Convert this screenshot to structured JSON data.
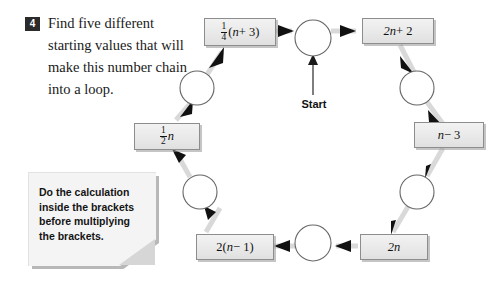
{
  "question": {
    "number": "4",
    "text": "Find five different starting values that will make this number chain into a loop."
  },
  "note": {
    "text": "Do the calculation inside the brackets before multiplying the brackets."
  },
  "diagram": {
    "start_label": "Start",
    "nodes": [
      {
        "id": "start",
        "type": "circle",
        "cx": 313,
        "cy": 38,
        "r": 18
      },
      {
        "id": "node-2",
        "type": "circle",
        "cx": 417,
        "cy": 88,
        "r": 17
      },
      {
        "id": "node-3",
        "type": "circle",
        "cx": 417,
        "cy": 192,
        "r": 17
      },
      {
        "id": "node-4",
        "type": "circle",
        "cx": 313,
        "cy": 243,
        "r": 18
      },
      {
        "id": "node-5",
        "type": "circle",
        "cx": 200,
        "cy": 192,
        "r": 17
      },
      {
        "id": "node-6",
        "type": "circle",
        "cx": 197,
        "cy": 88,
        "r": 17
      }
    ],
    "operations": [
      {
        "id": "op-2nplus2",
        "label": "2n + 2",
        "plain": "2n + 2"
      },
      {
        "id": "op-nminus3",
        "label": "n - 3",
        "plain": "n − 3"
      },
      {
        "id": "op-2n",
        "label": "2n",
        "plain": "2n"
      },
      {
        "id": "op-2nminus1",
        "label": "2(n - 1)",
        "plain": "2(n − 1)"
      },
      {
        "id": "op-halfn",
        "label": "1/2 n",
        "numerator": "1",
        "denominator": "2",
        "suffix": "n"
      },
      {
        "id": "op-quarter",
        "label": "1/4 (n + 3)",
        "numerator": "1",
        "denominator": "4",
        "suffix": "(n + 3)"
      }
    ],
    "box_text": {
      "quarter_num": "1",
      "quarter_den": "4",
      "quarter_rest_open": "(",
      "quarter_rest_var": "n",
      "quarter_rest_close": " + 3)",
      "twon_plus_two_var": "2n",
      "twon_plus_two_rest": " + 2",
      "nminus3_var": "n",
      "nminus3_rest": " − 3",
      "twon_var": "2n",
      "two_nminus1_lead": "2(",
      "two_nminus1_var": "n",
      "two_nminus1_rest": " − 1)",
      "halfn_num": "1",
      "halfn_den": "2",
      "halfn_var": "n"
    }
  },
  "colors": {
    "badge_bg": "#2b2b2b",
    "badge_text": "#ffffff",
    "box_fill": "#ebebeb",
    "box_border": "#8d8d8d",
    "connector": "#d9d9d9",
    "arrowhead": "#111111",
    "note_fill": "#f4f4f4",
    "note_fold": "#d6d6d6",
    "page_bg": "#ffffff"
  }
}
